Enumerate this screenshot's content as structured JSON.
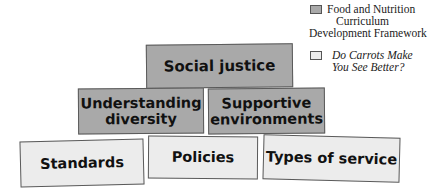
{
  "legend": {
    "items": [
      {
        "label_lines": [
          "Food and Nutrition",
          "Curriculum",
          "Development Framework"
        ],
        "color": "#a9a9a9",
        "italic": false
      },
      {
        "label_lines": [
          "Do Carrots Make",
          "You See Better?"
        ],
        "color": "#ececec",
        "italic": true
      }
    ]
  },
  "diagram": {
    "tiers": [
      {
        "level": "top",
        "boxes": [
          {
            "label": "Social justice",
            "fill": "dark"
          }
        ]
      },
      {
        "level": "middle",
        "boxes": [
          {
            "label_lines": [
              "Understanding",
              "diversity"
            ],
            "fill": "dark"
          },
          {
            "label_lines": [
              "Supportive",
              "environments"
            ],
            "fill": "dark"
          }
        ]
      },
      {
        "level": "bottom",
        "boxes": [
          {
            "label": "Standards",
            "fill": "light"
          },
          {
            "label": "Policies",
            "fill": "light"
          },
          {
            "label": "Types of service",
            "fill": "light"
          }
        ]
      }
    ]
  }
}
